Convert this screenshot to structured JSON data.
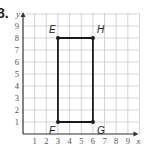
{
  "problem": {
    "number": "8."
  },
  "chart_data": {
    "type": "scatter",
    "title": "",
    "xlabel": "x",
    "ylabel": "y",
    "xlim": [
      0,
      10
    ],
    "ylim": [
      0,
      10
    ],
    "grid": true,
    "x_ticks": [
      "1",
      "2",
      "3",
      "4",
      "5",
      "6",
      "7",
      "8",
      "9"
    ],
    "y_ticks": [
      "1",
      "2",
      "3",
      "4",
      "5",
      "6",
      "7",
      "8",
      "9"
    ],
    "points": [
      {
        "label": "E",
        "x": 3,
        "y": 8
      },
      {
        "label": "H",
        "x": 6,
        "y": 8
      },
      {
        "label": "G",
        "x": 6,
        "y": 1
      },
      {
        "label": "F",
        "x": 3,
        "y": 1
      }
    ],
    "polygon": [
      "E",
      "H",
      "G",
      "F"
    ],
    "colors": {
      "grid": "#c8c8c8",
      "axis": "#333333",
      "shape": "#1a1a1a",
      "text": "#555555"
    }
  }
}
